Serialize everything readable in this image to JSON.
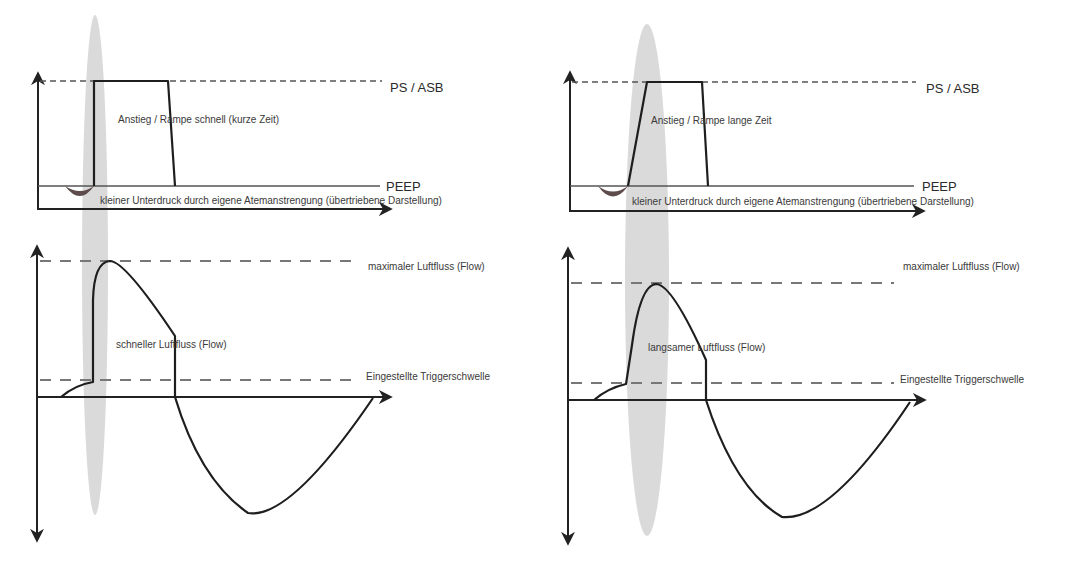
{
  "colors": {
    "line": "#1e1e1e",
    "dashed": "#777777",
    "highlight_ellipse": "#d3d3d3",
    "effort_dip": "#5e4b4b",
    "background": "#ffffff"
  },
  "panels": [
    {
      "id": "fast",
      "pressure": {
        "ps_label": "PS / ASB",
        "peep_label": "PEEP",
        "ramp_label": "Anstieg / Rampe schnell (kurze Zeit)",
        "effort_label": "kleiner Unterdruck durch eigene Atemanstrengung (übertriebene Darstellung)"
      },
      "flow": {
        "max_label": "maximaler Luftfluss (Flow)",
        "flow_label": "schneller Luftfluss (Flow)",
        "trigger_label": "Eingestellte Triggerschwelle"
      }
    },
    {
      "id": "slow",
      "pressure": {
        "ps_label": "PS / ASB",
        "peep_label": "PEEP",
        "ramp_label": "Anstieg / Rampe lange Zeit",
        "effort_label": "kleiner Unterdruck durch eigene Atemanstrengung (übertriebene Darstellung)"
      },
      "flow": {
        "max_label": "maximaler Luftfluss (Flow)",
        "flow_label": "langsamer Luftfluss (Flow)",
        "trigger_label": "Eingestellte Triggerschwelle"
      }
    }
  ]
}
